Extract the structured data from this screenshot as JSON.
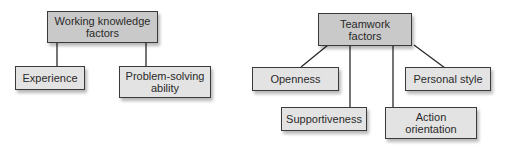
{
  "diagrams": [
    {
      "root": {
        "label": "Working knowledge\nfactors"
      },
      "children": [
        {
          "label": "Experience"
        },
        {
          "label": "Problem-solving\nability"
        }
      ]
    },
    {
      "root": {
        "label": "Teamwork\nfactors"
      },
      "children": [
        {
          "label": "Openness"
        },
        {
          "label": "Supportiveness"
        },
        {
          "label": "Action\norientation"
        },
        {
          "label": "Personal style"
        }
      ]
    }
  ],
  "colors": {
    "parent_fill": "#c9c9c9",
    "child_fill": "#e3e3e3",
    "border": "#3a3a3a",
    "connector": "#2a2a2a"
  }
}
